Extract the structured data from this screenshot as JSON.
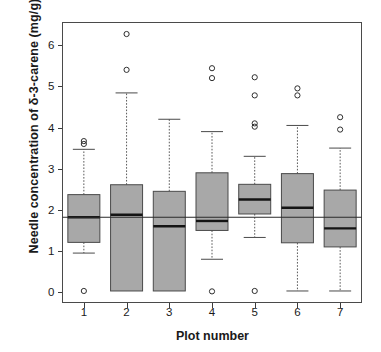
{
  "chart_data": {
    "type": "box",
    "title": "",
    "xlabel": "Plot number",
    "ylabel": "Needle concentration of δ-3-carene (mg/g)",
    "categories": [
      "1",
      "2",
      "3",
      "4",
      "5",
      "6",
      "7"
    ],
    "ylim": [
      -0.25,
      6.55
    ],
    "yticks": [
      0,
      1,
      2,
      3,
      4,
      5,
      6
    ],
    "ytick_labels": [
      "0",
      "1",
      "2",
      "3",
      "4",
      "5",
      "6"
    ],
    "grid": false,
    "legend": "none",
    "reference_line": {
      "orientation": "horizontal",
      "y": 1.82,
      "style": "solid"
    },
    "boxes": [
      {
        "category": "1",
        "whisker_low": 0.95,
        "q1": 1.21,
        "median": 1.82,
        "q3": 2.37,
        "whisker_high": 3.47,
        "outliers": [
          0.03,
          3.6,
          3.67
        ]
      },
      {
        "category": "2",
        "whisker_low": 0.03,
        "q1": 0.03,
        "median": 1.88,
        "q3": 2.61,
        "whisker_high": 4.84,
        "outliers": [
          5.4,
          6.27
        ]
      },
      {
        "category": "3",
        "whisker_low": 0.03,
        "q1": 0.03,
        "median": 1.6,
        "q3": 2.45,
        "whisker_high": 4.2,
        "outliers": []
      },
      {
        "category": "4",
        "whisker_low": 0.8,
        "q1": 1.5,
        "median": 1.73,
        "q3": 2.9,
        "whisker_high": 3.9,
        "outliers": [
          0.02,
          5.2,
          5.44
        ]
      },
      {
        "category": "5",
        "whisker_low": 1.33,
        "q1": 1.9,
        "median": 2.25,
        "q3": 2.62,
        "whisker_high": 3.3,
        "outliers": [
          0.03,
          4.02,
          4.1,
          4.78,
          5.22
        ]
      },
      {
        "category": "6",
        "whisker_low": 0.03,
        "q1": 1.2,
        "median": 2.05,
        "q3": 2.88,
        "whisker_high": 4.05,
        "outliers": [
          4.78,
          4.95
        ]
      },
      {
        "category": "7",
        "whisker_low": 0.03,
        "q1": 1.1,
        "median": 1.55,
        "q3": 2.48,
        "whisker_high": 3.5,
        "outliers": [
          3.95,
          4.25
        ]
      }
    ],
    "colors": {
      "box_fill": "#a8a8a8",
      "box_border": "#4a4a4a",
      "median": "#141414",
      "outlier": "#2e2e2e"
    }
  }
}
